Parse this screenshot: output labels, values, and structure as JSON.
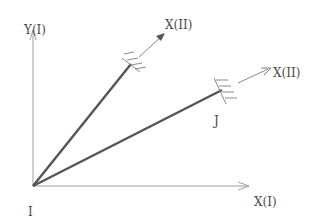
{
  "diagram": {
    "type": "coordinate-frame-diagram",
    "colors": {
      "background": "#ffffff",
      "axis": "#9a9a9a",
      "member": "#555555",
      "label": "#4a4a4a",
      "hatch": "#8a8a8a"
    },
    "labels": {
      "y_axis": "Y(I)",
      "x_axis": "X(I)",
      "origin": "I",
      "node_j": "J",
      "local_x_upper": "X(II)",
      "local_x_lower": "X(II)"
    },
    "elements": [
      {
        "id": "global-x-axis",
        "kind": "arrow",
        "from": [
          33,
          186
        ],
        "to": [
          250,
          186
        ]
      },
      {
        "id": "global-y-axis",
        "kind": "arrow",
        "from": [
          33,
          186
        ],
        "to": [
          33,
          28
        ]
      },
      {
        "id": "member-upper",
        "kind": "bold-line",
        "from": [
          33,
          186
        ],
        "to": [
          131,
          64
        ]
      },
      {
        "id": "member-lower",
        "kind": "bold-line",
        "from": [
          33,
          186
        ],
        "to": [
          222,
          90
        ]
      },
      {
        "id": "local-axis-upper",
        "kind": "arrow",
        "from": [
          139,
          58
        ],
        "to": [
          165,
          33
        ]
      },
      {
        "id": "local-axis-lower",
        "kind": "arrow",
        "from": [
          240,
          82
        ],
        "to": [
          270,
          69
        ]
      }
    ]
  }
}
